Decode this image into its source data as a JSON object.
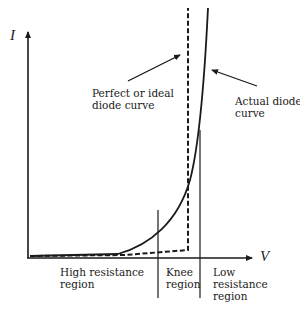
{
  "diagram": {
    "axes": {
      "y_label": "I",
      "x_label": "V"
    },
    "annotations": {
      "ideal": {
        "line1": "Perfect or ideal",
        "line2": "diode curve"
      },
      "actual": {
        "line1": "Actual diode",
        "line2": "curve"
      }
    },
    "regions": {
      "high": {
        "line1": "High resistance",
        "line2": "region"
      },
      "knee": {
        "line1": "Knee",
        "line2": "region"
      },
      "low": {
        "line1": "Low",
        "line2": "resistance",
        "line3": "region"
      }
    },
    "colors": {
      "ink": "#1a1a1a",
      "background": "#ffffff"
    }
  }
}
